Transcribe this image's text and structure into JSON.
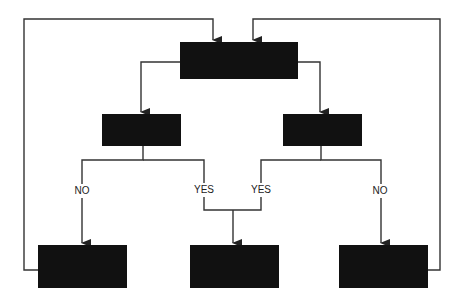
{
  "diagram": {
    "type": "flowchart",
    "colors": {
      "box": "#111111",
      "line": "#333333",
      "background": "#ffffff"
    },
    "nodes": [
      {
        "id": "top",
        "label": "",
        "x": 180,
        "y": 42,
        "w": 118,
        "h": 37
      },
      {
        "id": "left-mid",
        "label": "",
        "x": 102,
        "y": 114,
        "w": 79,
        "h": 32
      },
      {
        "id": "right-mid",
        "label": "",
        "x": 283,
        "y": 114,
        "w": 79,
        "h": 32
      },
      {
        "id": "bottom-left",
        "label": "",
        "x": 38,
        "y": 245,
        "w": 89,
        "h": 43
      },
      {
        "id": "bottom-center",
        "label": "",
        "x": 190,
        "y": 245,
        "w": 89,
        "h": 43
      },
      {
        "id": "bottom-right",
        "label": "",
        "x": 339,
        "y": 245,
        "w": 89,
        "h": 43
      }
    ],
    "edge_labels": {
      "left_no": "NO",
      "left_yes": "YES",
      "right_yes": "YES",
      "right_no": "NO"
    }
  }
}
